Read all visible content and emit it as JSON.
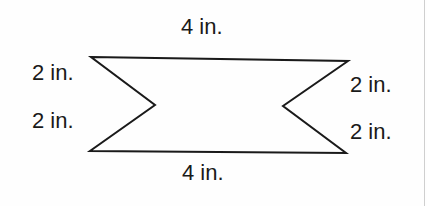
{
  "figure": {
    "type": "hexagon-bowtie",
    "stroke_color": "#1a1a1a",
    "vertices": [
      {
        "name": "top-left",
        "x": 91,
        "y": 57
      },
      {
        "name": "top-right",
        "x": 348,
        "y": 61
      },
      {
        "name": "right-notch",
        "x": 283,
        "y": 106
      },
      {
        "name": "bottom-right",
        "x": 346,
        "y": 153
      },
      {
        "name": "bottom-left",
        "x": 90,
        "y": 151
      },
      {
        "name": "left-notch",
        "x": 155,
        "y": 105
      }
    ]
  },
  "labels": {
    "top": "4 in.",
    "bottom": "4 in.",
    "left_upper": "2 in.",
    "left_lower": "2 in.",
    "right_upper": "2 in.",
    "right_lower": "2 in."
  }
}
